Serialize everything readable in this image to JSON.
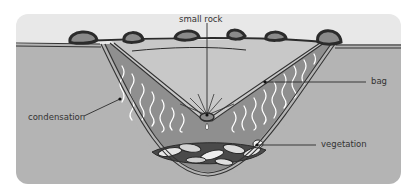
{
  "diagram": {
    "colors": {
      "background": "#ffffff",
      "sky_band": "#e8e8e8",
      "ground": "#b4b4b4",
      "pit_air": "#c8c8c8",
      "bag_fill": "#8f8f8f",
      "outline": "#333333",
      "rock_fill": "#8a8a8a",
      "rock_outline": "#2b2b2b",
      "condensation": "#ffffff",
      "label_text": "#333333"
    },
    "labels": {
      "small_rock": "small rock",
      "bag": "bag",
      "condensation": "condensation",
      "vegetation": "vegetation"
    },
    "components": [
      {
        "name": "plastic-sheet",
        "label": null
      },
      {
        "name": "small-rock",
        "label": "small rock"
      },
      {
        "name": "bag",
        "label": "bag"
      },
      {
        "name": "condensation",
        "label": "condensation"
      },
      {
        "name": "vegetation",
        "label": "vegetation"
      },
      {
        "name": "anchor-rocks",
        "count": 7
      }
    ]
  }
}
